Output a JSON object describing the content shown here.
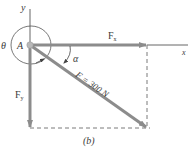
{
  "figure": {
    "caption": "(b)",
    "colors": {
      "vector": "#8c8c8c",
      "axis": "#555555",
      "dashed": "#7a7a7a",
      "text": "#3a3a3a",
      "origin": "#b0b0b0"
    }
  },
  "axes": {
    "x_label": "x",
    "y_label": "y"
  },
  "origin": {
    "label": "A"
  },
  "vectors": {
    "fx": {
      "label_main": "F",
      "label_sub": "x"
    },
    "fy": {
      "label_main": "F",
      "label_sub": "y"
    },
    "f": {
      "label": "F = 300 N"
    }
  },
  "angles": {
    "theta": {
      "label": "θ"
    },
    "alpha": {
      "label": "α"
    }
  }
}
